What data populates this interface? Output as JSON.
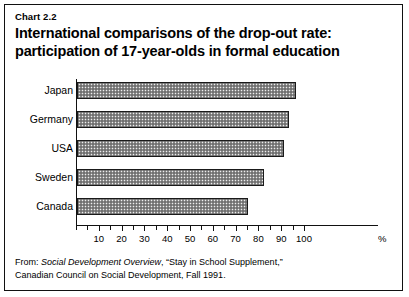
{
  "header": {
    "chart_number": "Chart 2.2",
    "title_line1": "International comparisons of the drop-out rate:",
    "title_line2": "participation of 17-year-olds in formal education"
  },
  "footer": {
    "line1_prefix": "From: ",
    "line1_source": "Social Development Overview",
    "line1_suffix": ", “Stay in School Supplement,”",
    "line2": "Canadian Council on Social Development, Fall 1991."
  },
  "chart_data": {
    "type": "bar",
    "orientation": "horizontal",
    "title": "International comparisons of the drop-out rate: participation of 17-year-olds in formal education",
    "categories": [
      "Japan",
      "Germany",
      "USA",
      "Sweden",
      "Canada"
    ],
    "values": [
      96,
      93,
      91,
      82,
      75
    ],
    "xlabel": "%",
    "ylabel": "",
    "xlim": [
      0,
      102
    ],
    "xticks": [
      0,
      5,
      10,
      15,
      20,
      25,
      30,
      35,
      40,
      45,
      50,
      55,
      60,
      65,
      70,
      75,
      80,
      85,
      90,
      95,
      100
    ],
    "xtick_labels": [
      "10",
      "20",
      "30",
      "40",
      "50",
      "60",
      "70",
      "80",
      "90",
      "100"
    ],
    "xtick_label_values": [
      10,
      20,
      30,
      40,
      50,
      60,
      70,
      80,
      90,
      100
    ],
    "grid": false,
    "legend": false,
    "bar_fill": "#8d8d8d",
    "bar_edge": "#1a1a1a",
    "unit_label": "%"
  }
}
